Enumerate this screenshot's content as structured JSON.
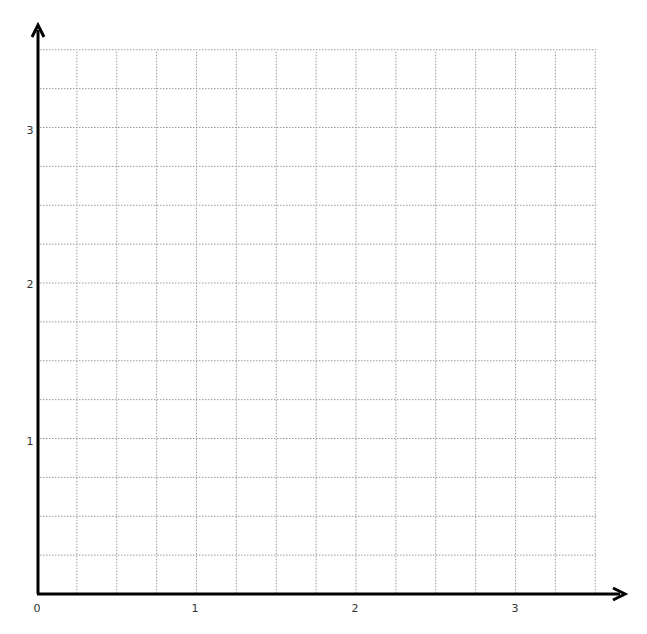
{
  "chart_data": {
    "type": "scatter",
    "title": "",
    "xlabel": "",
    "ylabel": "",
    "xlim": [
      0,
      3.5
    ],
    "ylim": [
      0,
      3.5
    ],
    "x_ticks": [
      "0",
      "1",
      "2",
      "3"
    ],
    "y_ticks": [
      "1",
      "2",
      "3"
    ],
    "grid": true,
    "grid_step": 0.25,
    "grid_style": "dotted",
    "series": [],
    "legend": null,
    "axes_arrows": true
  },
  "labels": {
    "x0": "0",
    "x1": "1",
    "x2": "2",
    "x3": "3",
    "y1": "1",
    "y2": "2",
    "y3": "3"
  },
  "colors": {
    "axis": "#000000",
    "grid": "#9a9a9a",
    "text": "#333333",
    "background": "#ffffff"
  }
}
